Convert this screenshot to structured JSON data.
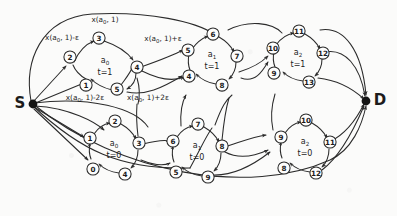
{
  "figure": {
    "kind": "time-expanded-network-graph",
    "terminals": {
      "source": "S",
      "sink": "D"
    },
    "background_color": "#fbfbfa",
    "ink_color": "#2b2b2b"
  },
  "clusters": [
    {
      "id": "a0-t1",
      "agent": "a",
      "agent_sub": "0",
      "time_label": "t=1",
      "nodes": [
        "1",
        "2",
        "3",
        "4",
        "5"
      ],
      "row": "top"
    },
    {
      "id": "a1-t1",
      "agent": "a",
      "agent_sub": "1",
      "time_label": "t=1",
      "nodes": [
        "4",
        "5",
        "6",
        "7",
        "8"
      ],
      "row": "top"
    },
    {
      "id": "a2-t1",
      "agent": "a",
      "agent_sub": "2",
      "time_label": "t=1",
      "nodes": [
        "9",
        "10",
        "11",
        "12",
        "13"
      ],
      "row": "top"
    },
    {
      "id": "a0-t0",
      "agent": "a",
      "agent_sub": "0",
      "time_label": "t=0",
      "nodes": [
        "0",
        "1",
        "2",
        "3",
        "4"
      ],
      "row": "bottom"
    },
    {
      "id": "a1-t0",
      "agent": "a",
      "agent_sub": "1",
      "time_label": "t=0",
      "nodes": [
        "5",
        "6",
        "7",
        "8",
        "9"
      ],
      "row": "bottom"
    },
    {
      "id": "a2-t0",
      "agent": "a",
      "agent_sub": "2",
      "time_label": "t=0",
      "nodes": [
        "8",
        "9",
        "10",
        "11",
        "12"
      ],
      "row": "bottom"
    }
  ],
  "edge_labels": [
    {
      "id": "top-center",
      "text": "x(a",
      "sub": "0",
      "rest": ", 1)"
    },
    {
      "id": "upper-left",
      "text": "x(a",
      "sub": "0",
      "rest": ", 1)-ε"
    },
    {
      "id": "upper-right",
      "text": "x(a",
      "sub": "0",
      "rest": ", 1)+ε"
    },
    {
      "id": "lower-left",
      "text": "x(a",
      "sub": "0",
      "rest": ", 1)-2ε"
    },
    {
      "id": "lower-right",
      "text": "x(a",
      "sub": "0",
      "rest": ", 1)+2ε"
    }
  ]
}
